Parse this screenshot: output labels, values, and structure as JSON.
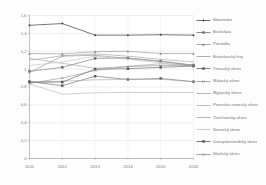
{
  "chart_data": {
    "type": "line",
    "title": "",
    "xlabel": "",
    "ylabel": "",
    "ylim": [
      0,
      1.6
    ],
    "ytick_labels": [
      "1,6",
      "1,4",
      "1,2",
      "1",
      "0,8",
      "0,6",
      "0,4",
      "0,2",
      "0"
    ],
    "ytick_values": [
      1.6,
      1.4,
      1.2,
      1.0,
      0.8,
      0.6,
      0.4,
      0.2,
      0
    ],
    "grid": true,
    "legend_position": "right",
    "categories": [
      "2011",
      "2012",
      "2013",
      "2014",
      "2015",
      "2016"
    ],
    "x": [
      2011,
      2012,
      2013,
      2014,
      2015,
      2016
    ],
    "series": [
      {
        "name": "Slovensko",
        "color": "#4a4a4a",
        "marker": "diamond",
        "values": [
          1.49,
          1.51,
          1.38,
          1.38,
          1.385,
          1.38
        ]
      },
      {
        "name": "Bratislava",
        "color": "#6d6d6d",
        "marker": "square",
        "values": [
          0.975,
          1.02,
          1.12,
          1.125,
          1.09,
          1.045
        ]
      },
      {
        "name": "Petržalka",
        "color": "#8a8a8a",
        "marker": "triangle",
        "values": [
          1.175,
          1.17,
          1.195,
          1.2,
          1.175,
          1.175
        ]
      },
      {
        "name": "Bratislavský kraj",
        "color": "#9a9a9a",
        "marker": "none",
        "values": [
          1.1,
          1.15,
          1.17,
          1.145,
          1.11,
          1.08
        ]
      },
      {
        "name": "Trnavský okres",
        "color": "#5f5f5f",
        "marker": "square",
        "values": [
          0.86,
          0.815,
          0.92,
          0.885,
          0.895,
          0.86
        ]
      },
      {
        "name": "Malacký okres",
        "color": "#8f8f8f",
        "marker": "cross",
        "values": [
          0.965,
          1.145,
          1.155,
          1.12,
          1.085,
          1.04
        ]
      },
      {
        "name": "Myjavský okres",
        "color": "#a5a5a5",
        "marker": "none",
        "values": [
          0.855,
          0.865,
          0.88,
          0.885,
          0.885,
          0.86
        ]
      },
      {
        "name": "Pezinsko-senecký okres",
        "color": "#b0b0b0",
        "marker": "none",
        "values": [
          0.835,
          0.72,
          0.735,
          0.74,
          0.74,
          0.74
        ]
      },
      {
        "name": "Trenčiansky okres",
        "color": "#9e9e9e",
        "marker": "none",
        "values": [
          1.12,
          1.065,
          1.01,
          1.03,
          1.06,
          1.045
        ]
      },
      {
        "name": "Senecký okres",
        "color": "#bcbcbc",
        "marker": "none",
        "values": [
          1.04,
          1.08,
          1.145,
          1.11,
          1.07,
          1.03
        ]
      },
      {
        "name": "Dunajskostredský okres",
        "color": "#555555",
        "marker": "square",
        "values": [
          0.855,
          0.855,
          1.0,
          1.005,
          1.02,
          1.035
        ]
      },
      {
        "name": "Skalický okres",
        "color": "#8c8c8c",
        "marker": "cross",
        "values": [
          0.84,
          0.9,
          0.985,
          1.03,
          1.04,
          1.045
        ]
      }
    ]
  },
  "axes": {
    "y_labels": [
      "1,6",
      "1,4",
      "1,2",
      "1",
      "0,8",
      "0,6",
      "0,4",
      "0,2",
      "0"
    ],
    "x_labels": [
      "2011",
      "2012",
      "2013",
      "2014",
      "2015",
      "2016"
    ]
  },
  "legend": {
    "items": [
      {
        "label": "Slovensko"
      },
      {
        "label": "Bratislava"
      },
      {
        "label": "Petržalka"
      },
      {
        "label": "Bratislavský kraj"
      },
      {
        "label": "Trnavský okres"
      },
      {
        "label": "Malacký okres"
      },
      {
        "label": "Myjavský okres"
      },
      {
        "label": "Pezinsko-senecký okres"
      },
      {
        "label": "Trenčiansky okres"
      },
      {
        "label": "Senecký okres"
      },
      {
        "label": "Dunajskostredský okres"
      },
      {
        "label": "Skalický okres"
      }
    ]
  },
  "colors": {
    "background": "#fdfdfd",
    "grid": "#d6d6d6",
    "axis": "#9a9a9a",
    "text": "#70706f"
  }
}
